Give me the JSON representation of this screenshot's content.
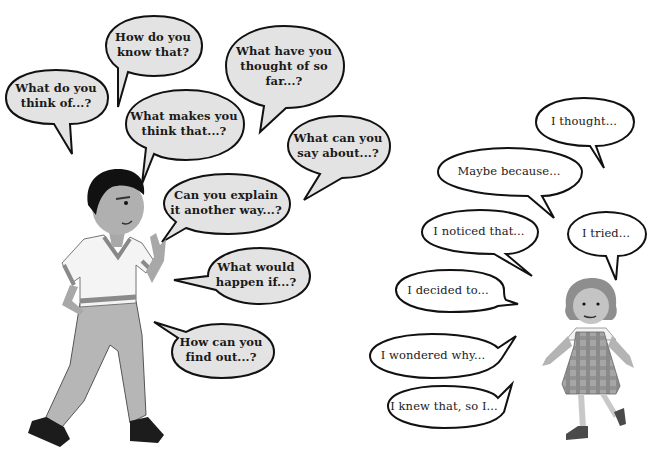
{
  "colors": {
    "question_bubble_fill": "#e3e3e3",
    "answer_bubble_fill": "#ffffff",
    "outline": "#111111"
  },
  "boy": {
    "label": "boy-character",
    "questions": [
      {
        "line1": "What do you",
        "line2": "think of...?"
      },
      {
        "line1": "How do you",
        "line2": "know that?"
      },
      {
        "line1": "What have you",
        "line2": "thought of so",
        "line3": "far...?"
      },
      {
        "line1": "What makes you",
        "line2": "think that...?"
      },
      {
        "line1": "What can you",
        "line2": "say about...?"
      },
      {
        "line1": "Can you explain",
        "line2": "it another way...?"
      },
      {
        "line1": "What would",
        "line2": "happen if...?"
      },
      {
        "line1": "How can you",
        "line2": "find out...?"
      }
    ]
  },
  "girl": {
    "label": "girl-character",
    "responses": [
      "I thought...",
      "Maybe because...",
      "I noticed that...",
      "I tried...",
      "I decided to...",
      "I wondered why...",
      "I knew that, so I..."
    ]
  }
}
